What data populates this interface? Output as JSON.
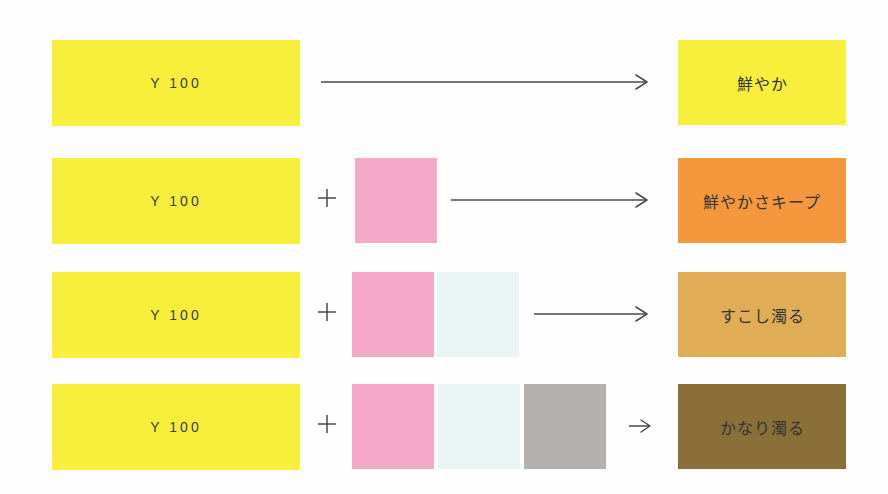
{
  "colors": {
    "yellow": "#F7EF3B",
    "magenta_tint": "#F3A9C7",
    "cyan_tint": "#E9F6F5",
    "gray": "#B3B1AF",
    "orange": "#F5973C",
    "ochre": "#E0AC55",
    "olive": "#8A7038",
    "arrow": "#4a4a4a",
    "label_text": "#3a3a3a"
  },
  "rows": [
    {
      "base_label": "Y 100",
      "base_color": "#F7EF3B",
      "added_swatches": [],
      "result_label": "鮮やか",
      "result_color": "#F7EF3B"
    },
    {
      "base_label": "Y 100",
      "base_color": "#F7EF3B",
      "added_swatches": [
        "magenta_tint"
      ],
      "result_label": "鮮やかさキープ",
      "result_color": "#F5973C"
    },
    {
      "base_label": "Y 100",
      "base_color": "#F7EF3B",
      "added_swatches": [
        "magenta_tint",
        "cyan_tint"
      ],
      "result_label": "すこし濁る",
      "result_color": "#E0AC55"
    },
    {
      "base_label": "Y 100",
      "base_color": "#F7EF3B",
      "added_swatches": [
        "magenta_tint",
        "cyan_tint",
        "gray"
      ],
      "result_label": "かなり濁る",
      "result_color": "#8A7038"
    }
  ]
}
